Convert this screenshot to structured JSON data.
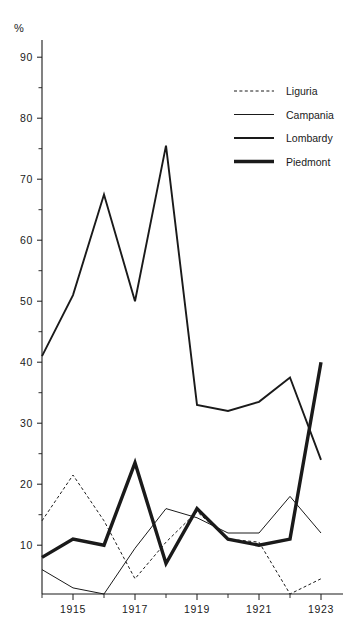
{
  "chart_data": {
    "type": "line",
    "title": "",
    "subtitle": "",
    "xlabel": "",
    "ylabel": "%",
    "unit_symbol": "%",
    "x": [
      1914,
      1915,
      1916,
      1917,
      1918,
      1919,
      1920,
      1921,
      1922,
      1923
    ],
    "xtick_labels": [
      "1915",
      "1917",
      "1919",
      "1921",
      "1923"
    ],
    "xtick_values": [
      1915,
      1917,
      1919,
      1921,
      1923
    ],
    "xlim": [
      1914,
      1923
    ],
    "ytick_labels": [
      "10",
      "20",
      "30",
      "40",
      "50",
      "60",
      "70",
      "80",
      "90"
    ],
    "ytick_values": [
      10,
      20,
      30,
      40,
      50,
      60,
      70,
      80,
      90
    ],
    "yminor_values": [
      15,
      25,
      35,
      45,
      55,
      65,
      75,
      85
    ],
    "ylim": [
      2,
      94
    ],
    "grid": false,
    "legend_position": "upper right",
    "series": [
      {
        "name": "Liguria",
        "style": "dashed",
        "stroke_width": 1.0,
        "dash": "3,2.4",
        "color": "#1a1a1a",
        "values": [
          14,
          21.5,
          14,
          4.5,
          10.5,
          15.5,
          11,
          10.5,
          2,
          4.5
        ]
      },
      {
        "name": "Campania",
        "style": "thin",
        "stroke_width": 1.0,
        "dash": "",
        "color": "#1a1a1a",
        "values": [
          6,
          3,
          2,
          9.5,
          16,
          14.5,
          12,
          12,
          18,
          12
        ]
      },
      {
        "name": "Lombardy",
        "style": "medium",
        "stroke_width": 1.9,
        "dash": "",
        "color": "#1a1a1a",
        "values": [
          41,
          51,
          67.5,
          50,
          75.5,
          33,
          32,
          33.5,
          37.5,
          24
        ]
      },
      {
        "name": "Piedmont",
        "style": "thick",
        "stroke_width": 3.4,
        "dash": "",
        "color": "#1a1a1a",
        "values": [
          8,
          11,
          10,
          23.5,
          7,
          16,
          11,
          10,
          11,
          40
        ]
      }
    ]
  },
  "legend": {
    "entries": [
      {
        "label": "Liguria"
      },
      {
        "label": "Campania"
      },
      {
        "label": "Lombardy"
      },
      {
        "label": "Piedmont"
      }
    ]
  }
}
